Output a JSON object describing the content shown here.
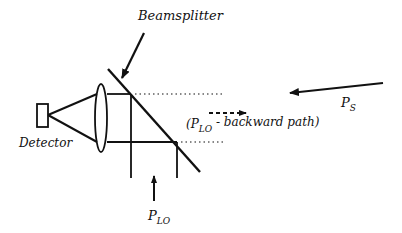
{
  "diagram": {
    "type": "optical heterodyne receiver schematic",
    "labels": {
      "beamsplitter": "Beamsplitter",
      "detector": "Detector",
      "backward_path_open": "(P",
      "backward_path_sub": "LO",
      "backward_path_rest": " - backward path)",
      "ps_main": "P",
      "ps_sub": "S",
      "plo_main": "P",
      "plo_sub": "LO"
    },
    "components": [
      {
        "name": "detector",
        "shape": "rectangle"
      },
      {
        "name": "lens",
        "shape": "ellipse"
      },
      {
        "name": "beamsplitter",
        "shape": "diagonal line"
      }
    ],
    "beams": [
      {
        "name": "signal",
        "label": "P_S",
        "direction": "leftward"
      },
      {
        "name": "local-oscillator",
        "label": "P_LO",
        "direction": "upward"
      },
      {
        "name": "lo-backward-path",
        "label": "(P_LO - backward path)",
        "direction": "rightward",
        "style": "dashed"
      }
    ],
    "colors": {
      "ink": "#111111",
      "background": "#ffffff"
    }
  }
}
